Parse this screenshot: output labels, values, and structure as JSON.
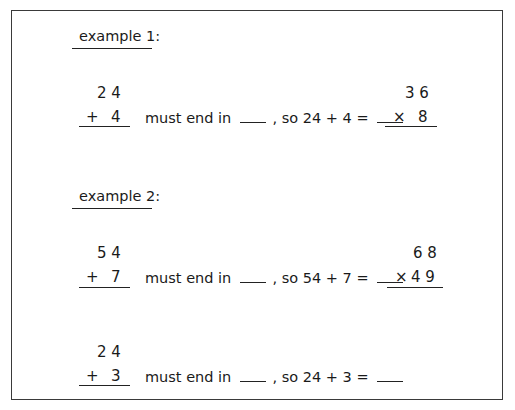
{
  "example1": {
    "heading": "example 1:",
    "problem_a": {
      "top": "2 4",
      "op": "+",
      "bottom": "4"
    },
    "sentence": {
      "prefix": "must end in",
      "middle": ", so 24 + 4 ="
    },
    "problem_b": {
      "top": "3 6",
      "op": "×",
      "bottom": "8"
    }
  },
  "example2": {
    "heading": "example 2:",
    "problem_a": {
      "top": "5 4",
      "op": "+",
      "bottom": "7"
    },
    "sentence": {
      "prefix": "must end in",
      "middle": ", so 54 + 7 ="
    },
    "problem_b": {
      "top": "6 8",
      "op": "×",
      "bottom": "4 9"
    },
    "problem_c": {
      "top": "2 4",
      "op": "+",
      "bottom": "3"
    },
    "sentence_c": {
      "prefix": "must end in",
      "middle": ", so 24 + 3 ="
    }
  }
}
